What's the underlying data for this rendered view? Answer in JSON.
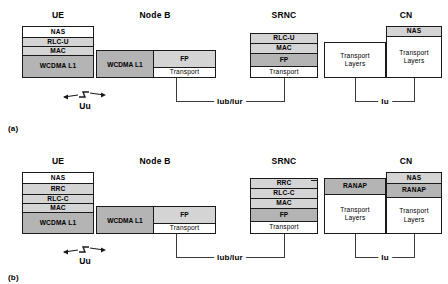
{
  "figure": {
    "panels": [
      {
        "id": "a",
        "label": "(a)",
        "nodes": {
          "ue": {
            "title": "UE",
            "layers": [
              {
                "label": "NAS",
                "fill": "white"
              },
              {
                "label": "RLC-U",
                "fill": "light"
              },
              {
                "label": "MAC",
                "fill": "light"
              },
              {
                "label": "WCDMA L1",
                "fill": "mid"
              }
            ]
          },
          "nodeb": {
            "title": "Node B",
            "left_layer": {
              "label": "WCDMA L1",
              "fill": "mid"
            },
            "right_layers": [
              {
                "label": "FP",
                "fill": "light"
              },
              {
                "label": "Transport",
                "fill": "white"
              }
            ]
          },
          "srnc": {
            "title": "SRNC",
            "left_stack": [
              {
                "label": "RLC-U",
                "fill": "light"
              },
              {
                "label": "MAC",
                "fill": "light"
              },
              {
                "label": "FP",
                "fill": "mid"
              },
              {
                "label": "Transport",
                "fill": "white"
              }
            ],
            "right_stack": [
              {
                "label": "Transport Layers",
                "line1": "Transport",
                "line2": "Layers",
                "fill": "white"
              }
            ]
          },
          "cn": {
            "title": "CN",
            "layers": [
              {
                "label": "NAS",
                "fill": "light"
              },
              {
                "label": "Transport Layers",
                "line1": "Transport",
                "line2": "Layers",
                "fill": "white"
              }
            ]
          }
        },
        "interfaces": {
          "radio": "Uu",
          "iub_iur": "Iub/Iur",
          "iu": "Iu"
        }
      },
      {
        "id": "b",
        "label": "(b)",
        "nodes": {
          "ue": {
            "title": "UE",
            "layers": [
              {
                "label": "NAS",
                "fill": "white"
              },
              {
                "label": "RRC",
                "fill": "light"
              },
              {
                "label": "RLC-C",
                "fill": "light"
              },
              {
                "label": "MAC",
                "fill": "light"
              },
              {
                "label": "WCDMA L1",
                "fill": "mid"
              }
            ]
          },
          "nodeb": {
            "title": "Node B",
            "left_layer": {
              "label": "WCDMA L1",
              "fill": "mid"
            },
            "right_layers": [
              {
                "label": "FP",
                "fill": "light"
              },
              {
                "label": "Transport",
                "fill": "white"
              }
            ]
          },
          "srnc": {
            "title": "SRNC",
            "left_stack": [
              {
                "label": "RRC",
                "fill": "light"
              },
              {
                "label": "RLC-C",
                "fill": "light"
              },
              {
                "label": "MAC",
                "fill": "light"
              },
              {
                "label": "FP",
                "fill": "mid"
              },
              {
                "label": "Transport",
                "fill": "white"
              }
            ],
            "right_stack": [
              {
                "label": "RANAP",
                "fill": "mid"
              },
              {
                "label": "Transport Layers",
                "line1": "Transport",
                "line2": "Layers",
                "fill": "white"
              }
            ]
          },
          "cn": {
            "title": "CN",
            "layers": [
              {
                "label": "NAS",
                "fill": "light"
              },
              {
                "label": "RANAP",
                "fill": "mid"
              },
              {
                "label": "Transport Layers",
                "line1": "Transport",
                "line2": "Layers",
                "fill": "white"
              }
            ]
          }
        },
        "interfaces": {
          "radio": "Uu",
          "iub_iur": "Iub/Iur",
          "iu": "Iu"
        }
      }
    ]
  },
  "colors": {
    "line": "#1a1a1a",
    "connector": "#3a3a3a",
    "fill_white": "#ffffff",
    "fill_light": "#d4d4d4",
    "fill_mid": "#b4b4b4"
  }
}
